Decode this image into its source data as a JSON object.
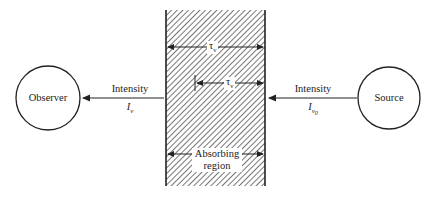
{
  "diagram": {
    "type": "radiative-transfer-schematic",
    "observer": {
      "label": "Observer"
    },
    "source": {
      "label": "Source"
    },
    "left_arrow": {
      "label": "Intensity",
      "symbol": "I",
      "subscript": "ν"
    },
    "right_arrow": {
      "label": "Intensity",
      "symbol": "I",
      "subscript": "ν",
      "subsubscript": "0"
    },
    "slab": {
      "label_line1": "Absorbing",
      "label_line2": "region",
      "total_depth": {
        "symbol": "τ",
        "subscript": "ν"
      },
      "partial_depth": {
        "symbol": "τ",
        "subscript": "ν",
        "prime": "′"
      }
    },
    "colors": {
      "ink": "#222222",
      "hatch": "#555555",
      "background": "#ffffff"
    }
  }
}
